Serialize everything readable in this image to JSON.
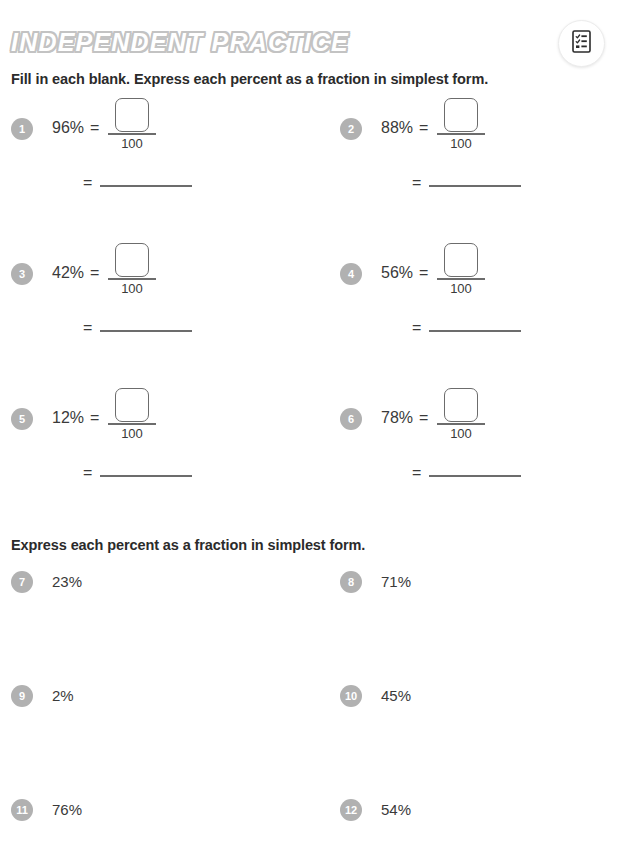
{
  "header": {
    "title": "INDEPENDENT PRACTICE",
    "toolbar_button": {
      "name": "worksheet-icon",
      "label": "worksheet-icon"
    }
  },
  "sections": [
    {
      "instruction": "Fill in each blank. Express each percent as a fraction in simplest form.",
      "denominator": "100",
      "equals": "=",
      "problems": [
        {
          "number": "1",
          "percent": "96%"
        },
        {
          "number": "2",
          "percent": "88%"
        },
        {
          "number": "3",
          "percent": "42%"
        },
        {
          "number": "4",
          "percent": "56%"
        },
        {
          "number": "5",
          "percent": "12%"
        },
        {
          "number": "6",
          "percent": "78%"
        }
      ]
    },
    {
      "instruction": "Express each percent as a fraction in simplest form.",
      "problems": [
        {
          "number": "7",
          "percent": "23%"
        },
        {
          "number": "8",
          "percent": "71%"
        },
        {
          "number": "9",
          "percent": "2%"
        },
        {
          "number": "10",
          "percent": "45%"
        },
        {
          "number": "11",
          "percent": "76%"
        },
        {
          "number": "12",
          "percent": "54%"
        }
      ]
    }
  ],
  "colors": {
    "background": "#ffffff",
    "text": "#3a3a3a",
    "heading_text": "#2b2b2b",
    "badge_fill": "#b1b1b1",
    "badge_text": "#ffffff",
    "title_fill": "#ffffff",
    "title_outline": "#c3c3c3",
    "line": "#6c6c6c"
  }
}
